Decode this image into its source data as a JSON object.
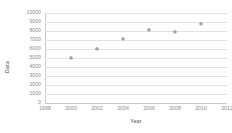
{
  "chart_data": {
    "type": "scatter",
    "title": "",
    "subtitle": "",
    "xlabel": "Year",
    "ylabel": "Data",
    "xlim": [
      1998,
      2012
    ],
    "ylim": [
      0,
      10000
    ],
    "xticks": [
      1998,
      2000,
      2002,
      2004,
      2006,
      2008,
      2010,
      2012
    ],
    "xtick_labels": [
      "1998",
      "2000",
      "2002",
      "2004",
      "2006",
      "2008",
      "2010",
      "2012"
    ],
    "yticks": [
      0,
      1000,
      2000,
      3000,
      4000,
      5000,
      6000,
      7000,
      8000,
      9000,
      10000
    ],
    "ytick_labels": [
      "0",
      "1000",
      "2000",
      "3000",
      "4000",
      "5000",
      "6000",
      "7000",
      "8000",
      "9000",
      "10000"
    ],
    "grid": true,
    "grid_axis": "y",
    "legend": false,
    "legend_position": "none",
    "marker": "diamond",
    "marker_color": "#a3a3a3",
    "grid_color": "#e2e2e2",
    "axis_color": "#c9c9c9",
    "text_color": "#8c8c8c",
    "background": "#ffffff",
    "x": [
      2000,
      2002,
      2004,
      2006,
      2008,
      2010
    ],
    "y": [
      5000,
      6000,
      7150,
      8150,
      7900,
      8800
    ],
    "series": [
      {
        "name": "Data",
        "points": [
          {
            "x": 2000,
            "y": 5000
          },
          {
            "x": 2002,
            "y": 6000
          },
          {
            "x": 2004,
            "y": 7150
          },
          {
            "x": 2006,
            "y": 8150
          },
          {
            "x": 2008,
            "y": 7900
          },
          {
            "x": 2010,
            "y": 8800
          }
        ]
      }
    ]
  }
}
